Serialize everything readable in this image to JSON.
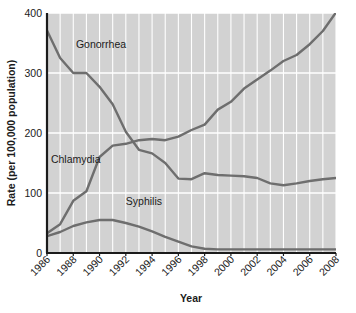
{
  "chart_data": {
    "type": "line",
    "title": "",
    "xlabel": "Year",
    "ylabel": "Rate (per 100,000 population)",
    "xlim": [
      1986,
      2008
    ],
    "ylim": [
      0,
      400
    ],
    "yticks": [
      0,
      100,
      200,
      300,
      400
    ],
    "xticks": [
      1986,
      1988,
      1990,
      1992,
      1994,
      1996,
      1998,
      2000,
      2002,
      2004,
      2006,
      2008
    ],
    "grid": "both-axes-white-gridlines-on-gray-panel",
    "legend_position": "inline-labels-on-plot",
    "x": [
      1986,
      1987,
      1988,
      1989,
      1990,
      1991,
      1992,
      1993,
      1994,
      1995,
      1996,
      1997,
      1998,
      1999,
      2000,
      2001,
      2002,
      2003,
      2004,
      2005,
      2006,
      2007,
      2008
    ],
    "series": [
      {
        "name": "Gonorrhea",
        "color": "#6e6e6e",
        "values": [
          371,
          325,
          300,
          300,
          277,
          248,
          202,
          172,
          166,
          150,
          124,
          123,
          133,
          130,
          129,
          128,
          125,
          116,
          113,
          116,
          120,
          123,
          125
        ]
      },
      {
        "name": "Chlamydia",
        "color": "#6e6e6e",
        "values": [
          33,
          48,
          87,
          103,
          160,
          179,
          182,
          188,
          190,
          188,
          194,
          205,
          214,
          239,
          252,
          274,
          289,
          304,
          320,
          330,
          348,
          370,
          401
        ]
      },
      {
        "name": "Syphilis",
        "color": "#6e6e6e",
        "values": [
          28,
          35,
          45,
          51,
          55,
          55,
          50,
          44,
          36,
          27,
          19,
          11,
          7,
          6,
          6,
          6,
          6,
          6,
          6,
          6,
          6,
          6,
          6
        ]
      }
    ],
    "annotations": [
      {
        "text": "Gonorrhea",
        "x": 1988.2,
        "y": 341
      },
      {
        "text": "Chlamydia",
        "x": 1986.3,
        "y": 150
      },
      {
        "text": "Syphilis",
        "x": 1992.0,
        "y": 80
      }
    ]
  },
  "axes": {
    "ylabel": "Rate (per 100,000 population)",
    "xlabel": "Year",
    "ytick_labels": [
      "0",
      "100",
      "200",
      "300",
      "400"
    ],
    "xtick_labels": [
      "1986",
      "1988",
      "1990",
      "1992",
      "1994",
      "1996",
      "1998",
      "2000",
      "2002",
      "2004",
      "2006",
      "2008"
    ]
  },
  "colors": {
    "panel_background": "#d2d2d2",
    "gridline": "#ffffff",
    "line": "#6e6e6e",
    "axis": "#1b1b1b",
    "text": "#1b1b1b",
    "page_background": "#ffffff"
  }
}
